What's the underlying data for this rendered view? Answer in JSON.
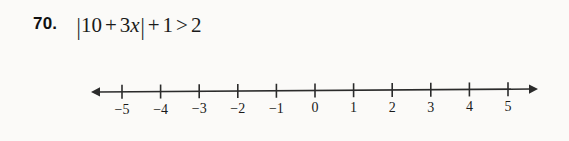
{
  "page": {
    "background_color": "#fbfaf8",
    "ink_color": "#2b2b2b"
  },
  "problem": {
    "number_label": "70.",
    "expression_plain": "|10 + 3x| + 1 > 2",
    "tokens": {
      "bar_open": "|",
      "first_term": "10",
      "plus_1": "+",
      "coefficient": "3",
      "variable": "x",
      "bar_close": "|",
      "plus_2": "+",
      "constant": "1",
      "relation": ">",
      "right_side": "2"
    }
  },
  "chart_data": {
    "type": "line",
    "title": "",
    "xlabel": "",
    "ylabel": "",
    "grid": false,
    "legend": "none",
    "axis_orientation": "horizontal",
    "xlim": [
      -5,
      5
    ],
    "tick_values": [
      -5,
      -4,
      -3,
      -2,
      -1,
      0,
      1,
      2,
      3,
      4,
      5
    ],
    "tick_labels": [
      "−5",
      "−4",
      "−3",
      "−2",
      "−1",
      "0",
      "1",
      "2",
      "3",
      "4",
      "5"
    ],
    "arrows": [
      "left",
      "right"
    ],
    "plotted_points": [],
    "shaded_intervals": [],
    "series": []
  },
  "geometry": {
    "axis_y": 32,
    "left_arrow_tip_x": 91,
    "right_arrow_tip_x": 538,
    "first_tick_x": 122,
    "tick_spacing": 38.6,
    "tick_half_height": 7,
    "label_baseline_y": 54
  }
}
